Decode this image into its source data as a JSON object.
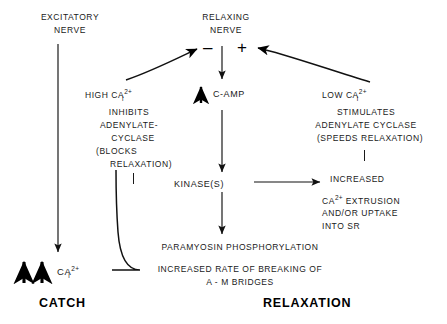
{
  "figure": {
    "type": "flow-diagram",
    "title_absent": true,
    "background_color": "#ffffff",
    "line_color": "#000000"
  },
  "nodes": {
    "excitatory_nerve": {
      "label_line1": "EXCITATORY",
      "label_line2": "NERVE"
    },
    "relaxing_nerve": {
      "label_line1": "RELAXING",
      "label_line2": "NERVE",
      "minus_sign": "–",
      "plus_sign": "+"
    },
    "high_ca_block": {
      "line1_pre": "HIGH CA",
      "line1_sup": "2+",
      "line1_sub": "i",
      "line2": "INHIBITS",
      "line3": "ADENYLATE-",
      "line4": "CYCLASE",
      "line5": "(BLOCKS",
      "line6": "RELAXATION)"
    },
    "low_ca_block": {
      "line1_pre": "LOW CA",
      "line1_sup": "2+",
      "line1_sub": "i",
      "line2": "STIMULATES",
      "line3": "ADENYLATE CYCLASE",
      "line4": "(SPEEDS RELAXATION)"
    },
    "camp": {
      "label": "C-AMP",
      "arrow_glyph": "↑"
    },
    "kinases": {
      "label": "KINASE(S)"
    },
    "increased_extrusion_block": {
      "line1": "INCREASED",
      "line2_pre": "CA",
      "line2_sup": "2+",
      "line2_post": " EXTRUSION",
      "line3": "AND/OR UPTAKE",
      "line4": "INTO SR"
    },
    "paramyosin": {
      "line1": "PARAMYOSIN PHOSPHORYLATION"
    },
    "bridges": {
      "line1": "INCREASED RATE OF BREAKING OF",
      "line2": "A - M BRIDGES"
    },
    "catch_ca": {
      "pre": "CA",
      "sup": "2+",
      "sub": "i",
      "arrow_glyph": "↑"
    }
  },
  "footers": {
    "left": "CATCH",
    "right": "RELAXATION"
  }
}
